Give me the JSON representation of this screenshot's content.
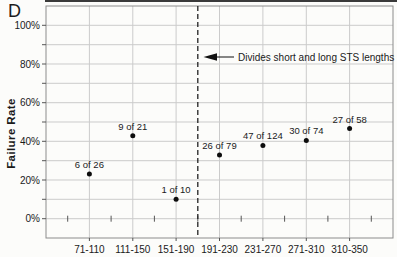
{
  "figure": {
    "panel_label": "D",
    "background": "#fcfcfa"
  },
  "chart_data": {
    "type": "scatter",
    "title": "",
    "xlabel": "",
    "ylabel": "Failure Rate",
    "categories": [
      "71-110",
      "111-150",
      "151-190",
      "191-230",
      "231-270",
      "271-310",
      "310-350"
    ],
    "values": [
      23.1,
      42.9,
      10.0,
      32.9,
      37.9,
      40.5,
      46.6
    ],
    "point_labels": [
      "6 of 26",
      "9 of 21",
      "1 of 10",
      "26 of 79",
      "47 of 124",
      "30 of 74",
      "27 of 58"
    ],
    "ylim": [
      -10,
      110
    ],
    "yticks": [
      0,
      20,
      40,
      60,
      80,
      100
    ],
    "ytick_labels": [
      "0%",
      "20%",
      "40%",
      "60%",
      "80%",
      "100%"
    ],
    "minor_grid_step": 10,
    "grid": true,
    "legend": "none",
    "divider": {
      "between": [
        "151-190",
        "191-230"
      ],
      "style": "dashed"
    },
    "annotation": {
      "text": "Divides short and long STS lengths",
      "arrow": "left",
      "y_percent": 82
    },
    "colors": {
      "point": "#0d0d0d",
      "grid": "#cbcbcb",
      "frame": "#8c8c8c",
      "tick": "#555555",
      "divider": "#222222",
      "text": "#1a1a1a"
    }
  }
}
